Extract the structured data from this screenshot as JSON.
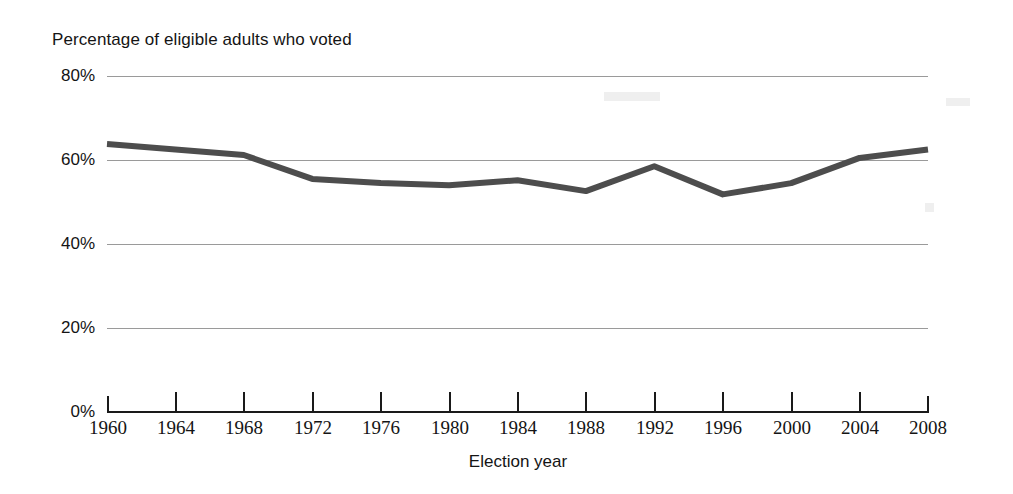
{
  "chart_data": {
    "type": "line",
    "title": "Percentage of eligible adults who voted",
    "xlabel": "Election year",
    "ylabel": "",
    "x": [
      1960,
      1964,
      1968,
      1972,
      1976,
      1980,
      1984,
      1988,
      1992,
      1996,
      2000,
      2004,
      2008
    ],
    "values": [
      63.8,
      62.5,
      61.2,
      55.5,
      54.5,
      54.0,
      55.2,
      52.6,
      58.5,
      51.8,
      54.5,
      60.5,
      62.5
    ],
    "series": [
      {
        "name": "Percentage of eligible adults who voted",
        "values": [
          63.8,
          62.5,
          61.2,
          55.5,
          54.5,
          54.0,
          55.2,
          52.6,
          58.5,
          51.8,
          54.5,
          60.5,
          62.5
        ]
      }
    ],
    "categories": [
      "1960",
      "1964",
      "1968",
      "1972",
      "1976",
      "1980",
      "1984",
      "1988",
      "1992",
      "1996",
      "2000",
      "2004",
      "2008"
    ],
    "xtick_labels": [
      "1960",
      "1964",
      "1968",
      "1972",
      "1976",
      "1980",
      "1984",
      "1988",
      "1992",
      "1996",
      "2000",
      "2004",
      "2008"
    ],
    "ytick_labels": [
      "0%",
      "20%",
      "40%",
      "60%",
      "80%"
    ],
    "ytick_values": [
      0,
      20,
      40,
      60,
      80
    ],
    "ylim": [
      0,
      80
    ],
    "xlim": [
      1960,
      2008
    ],
    "grid": "horizontal",
    "legend": "none",
    "line_color": "#4d4d4d",
    "grid_color": "#9a9a9a",
    "axis_color": "#1a1a1a",
    "background_color": "#ffffff"
  }
}
